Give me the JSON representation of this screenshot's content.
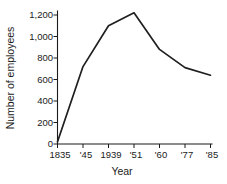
{
  "chart_data": {
    "type": "line",
    "title": "",
    "xlabel": "Year",
    "ylabel": "Number of employees",
    "categories": [
      "1835",
      "'45",
      "1939",
      "'51",
      "'60",
      "'77",
      "'85"
    ],
    "x_tick_labels": [
      "1835",
      "'45",
      "1939",
      "'51",
      "'60",
      "'77",
      "'85"
    ],
    "y_tick_labels": [
      "0",
      "200",
      "400",
      "600",
      "800",
      "1,000",
      "1,200"
    ],
    "y_tick_values": [
      0,
      200,
      400,
      600,
      800,
      1000,
      1200
    ],
    "ylim": [
      0,
      1300
    ],
    "grid": false,
    "legend": false,
    "legend_position": "none",
    "series": [
      {
        "name": "Number of employees",
        "values": [
          20,
          720,
          1100,
          1220,
          880,
          710,
          640
        ],
        "color": "#1f1f1f"
      }
    ],
    "points": [
      {
        "x": "1835",
        "y": 20
      },
      {
        "x": "'45",
        "y": 720
      },
      {
        "x": "1939",
        "y": 1100
      },
      {
        "x": "'51",
        "y": 1220
      },
      {
        "x": "'60",
        "y": 880
      },
      {
        "x": "'77",
        "y": 710
      },
      {
        "x": "'85",
        "y": 640
      }
    ]
  }
}
